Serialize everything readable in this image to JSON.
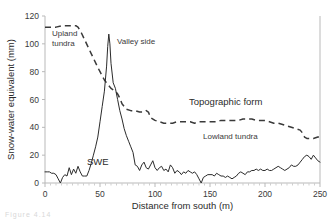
{
  "figure": {
    "caption_fragment": "Figure 4.14"
  },
  "chart_data": {
    "type": "line",
    "title": "",
    "xlabel": "Distance from south (m)",
    "ylabel": "Snow-water equivalent (mm)",
    "xlim": [
      0,
      250
    ],
    "ylim": [
      0,
      120
    ],
    "xticks": [
      0,
      50,
      100,
      150,
      200,
      250
    ],
    "yticks": [
      0,
      20,
      40,
      60,
      80,
      100,
      120
    ],
    "grid": false,
    "legend_position": "none",
    "annotations": [
      {
        "name": "upland-tundra",
        "text": "Upland\ntundra",
        "line1": "Upland",
        "line2": "tundra",
        "x": 12,
        "y": 104
      },
      {
        "name": "valley-side",
        "text": "Valley side",
        "x": 72,
        "y": 102
      },
      {
        "name": "topographic-form",
        "text": "Topographic form",
        "x": 130,
        "y": 55
      },
      {
        "name": "lowland-tundra",
        "text": "Lowland tundra",
        "x": 140,
        "y": 34
      },
      {
        "name": "swe",
        "text": "SWE",
        "x": 48,
        "y": 14
      }
    ],
    "series": [
      {
        "name": "SWE",
        "style": "solid",
        "color": "#2b2b2b",
        "x": [
          0,
          2,
          4,
          6,
          8,
          10,
          12,
          14,
          16,
          18,
          20,
          22,
          24,
          26,
          28,
          30,
          32,
          34,
          36,
          38,
          40,
          42,
          44,
          46,
          48,
          50,
          52,
          54,
          56,
          57,
          58,
          59,
          60,
          62,
          64,
          66,
          68,
          70,
          72,
          74,
          76,
          78,
          80,
          82,
          84,
          86,
          88,
          90,
          92,
          94,
          96,
          98,
          100,
          102,
          104,
          106,
          108,
          110,
          112,
          114,
          116,
          118,
          120,
          122,
          124,
          126,
          128,
          130,
          132,
          134,
          136,
          138,
          140,
          142,
          144,
          146,
          148,
          150,
          152,
          154,
          156,
          158,
          160,
          162,
          164,
          166,
          168,
          170,
          172,
          174,
          176,
          178,
          180,
          182,
          184,
          186,
          188,
          190,
          192,
          194,
          196,
          198,
          200,
          202,
          204,
          206,
          208,
          210,
          212,
          214,
          216,
          218,
          220,
          222,
          224,
          226,
          228,
          230,
          232,
          234,
          236,
          238,
          240,
          242,
          244,
          246,
          248,
          250
        ],
        "y": [
          8,
          8,
          8,
          7,
          7,
          6,
          3,
          0,
          4,
          6,
          5,
          11,
          6,
          10,
          7,
          12,
          8,
          5,
          5,
          5,
          9,
          14,
          20,
          26,
          33,
          44,
          55,
          66,
          84,
          98,
          107,
          100,
          86,
          72,
          68,
          60,
          52,
          46,
          39,
          34,
          30,
          26,
          22,
          13,
          12,
          9,
          13,
          15,
          11,
          10,
          13,
          16,
          11,
          9,
          11,
          12,
          9,
          10,
          8,
          13,
          11,
          7,
          9,
          8,
          6,
          8,
          7,
          9,
          8,
          7,
          8,
          6,
          3,
          0,
          4,
          5,
          6,
          6,
          6,
          5,
          7,
          6,
          5,
          5,
          4,
          5,
          4,
          3,
          4,
          5,
          7,
          8,
          7,
          6,
          8,
          8,
          9,
          9,
          10,
          9,
          10,
          9,
          9,
          10,
          9,
          9,
          10,
          11,
          12,
          11,
          10,
          9,
          10,
          11,
          13,
          12,
          12,
          13,
          15,
          17,
          19,
          20,
          19,
          17,
          20,
          18,
          16,
          15
        ]
      },
      {
        "name": "Topographic form",
        "style": "dashed",
        "color": "#3a3a3a",
        "x": [
          0,
          5,
          10,
          15,
          20,
          24,
          28,
          30,
          33,
          36,
          39,
          42,
          45,
          48,
          50,
          52,
          54,
          56,
          58,
          60,
          62,
          64,
          66,
          68,
          70,
          74,
          78,
          82,
          86,
          90,
          92,
          94,
          96,
          100,
          104,
          108,
          112,
          116,
          120,
          124,
          128,
          132,
          136,
          140,
          144,
          148,
          152,
          156,
          160,
          164,
          168,
          172,
          176,
          180,
          184,
          188,
          192,
          196,
          200,
          204,
          208,
          212,
          216,
          220,
          224,
          228,
          232,
          234,
          236,
          238,
          240,
          244,
          248,
          250
        ],
        "y": [
          112,
          112,
          112,
          113,
          113,
          113,
          113,
          112,
          108,
          103,
          98,
          93,
          88,
          83,
          80,
          77,
          74,
          72,
          70,
          68,
          67,
          66,
          64,
          61,
          57,
          53,
          52,
          52,
          51,
          51,
          52,
          51,
          47,
          45,
          44,
          43,
          43,
          43,
          44,
          44,
          44,
          44,
          43,
          44,
          44,
          44,
          44,
          44,
          45,
          45,
          45,
          45,
          45,
          46,
          46,
          46,
          45,
          45,
          45,
          44,
          43,
          43,
          42,
          41,
          40,
          39,
          38,
          36,
          33,
          32,
          32,
          32,
          33,
          33
        ]
      }
    ]
  }
}
